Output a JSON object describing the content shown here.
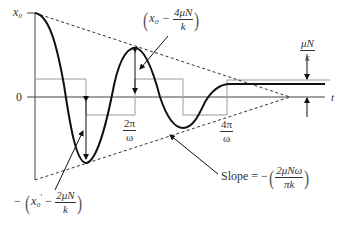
{
  "diagram": {
    "axis": {
      "y_top_label": "x₀",
      "y_zero_label": "0",
      "x_label": "t"
    },
    "annotations": {
      "peak2": {
        "prefix": "x₀ − ",
        "num": "4μN",
        "den": "k"
      },
      "trough1": {
        "prefix_minus": "−",
        "var": "x₀",
        "prime": "′",
        "minus": " − ",
        "num": "2μN",
        "den": "k"
      },
      "band": {
        "num": "μN",
        "den": "k"
      },
      "tick_2pi": {
        "num": "2π",
        "den": "ω"
      },
      "tick_4pi": {
        "num": "4π",
        "den": "ω"
      },
      "slope": {
        "prefix": "Slope = −",
        "num": "2μNω",
        "den": "πk"
      }
    },
    "colors": {
      "curve": "#111111",
      "axis": "#444444",
      "step": "#9a9a9a",
      "envelope": "#333333"
    }
  }
}
